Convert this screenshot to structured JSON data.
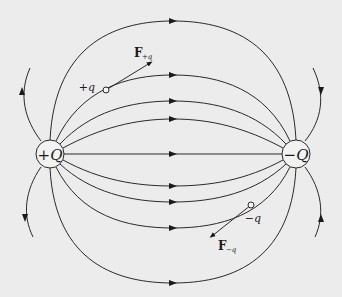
{
  "diagram": {
    "type": "electric field lines of a dipole",
    "background": "#ececec",
    "stroke_color": "#2a2a2a",
    "charges": {
      "positive": {
        "label": "+Q",
        "cx": 50,
        "cy": 154,
        "r": 14
      },
      "negative": {
        "label": "−Q",
        "cx": 296,
        "cy": 154,
        "r": 14
      }
    },
    "test_charges": {
      "positive": {
        "label": "+q",
        "force_label_main": "F",
        "force_label_sub": "+q",
        "x": 106,
        "y": 90
      },
      "negative": {
        "label": "−q",
        "force_label_main": "F",
        "force_label_sub": "−q",
        "x": 251,
        "y": 205
      }
    },
    "field_line_count": 9,
    "outer_line_count": 4
  }
}
